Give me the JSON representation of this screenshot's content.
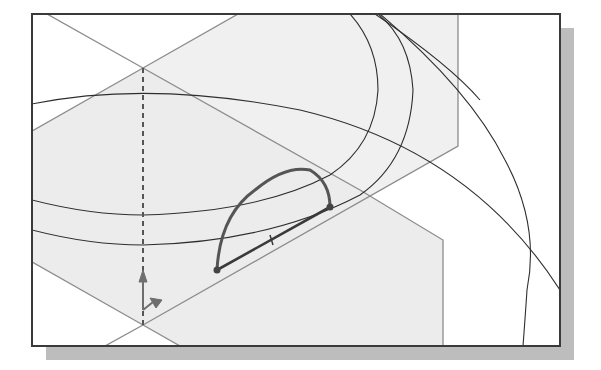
{
  "figure": {
    "colors": {
      "frame": "#3a3a3a",
      "shadow": "#bdbdbd",
      "plane_fill": "#efefef",
      "plane_edge": "#8c8c8c",
      "curve": "#2e2e2e",
      "profile": "#555555",
      "triad": "#6e6e6e"
    }
  },
  "frame": {
    "x": 32,
    "y": 14,
    "width": 528,
    "height": 332,
    "shadow_offset": 14
  },
  "elements": {
    "upper_plane": {
      "label": ""
    },
    "lower_plane": {
      "label": ""
    },
    "sketch_profile": {
      "type": "half-ellipse",
      "endpoint_a": [
        217,
        270
      ],
      "endpoint_b": [
        330,
        207
      ]
    },
    "axis_line": {
      "style": "dashed",
      "x": 143
    },
    "triad": {
      "origin": [
        143,
        310
      ]
    }
  }
}
